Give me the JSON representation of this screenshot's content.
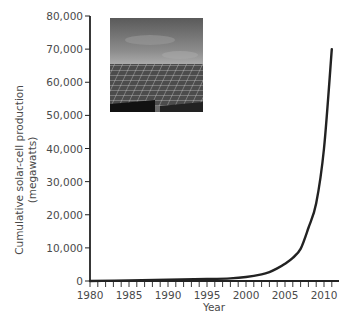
{
  "chart_data": {
    "type": "line",
    "title": "",
    "xlabel": "Year",
    "ylabel": "Cumulative solar-cell production (megawatts)",
    "ylabel_lines": [
      "Cumulative solar-cell production",
      "(megawatts)"
    ],
    "xlim": [
      1980,
      2011
    ],
    "ylim": [
      0,
      80000
    ],
    "x_ticks": [
      1980,
      1985,
      1990,
      1995,
      2000,
      2005,
      2010
    ],
    "x_tick_labels": [
      "1980",
      "1985",
      "1990",
      "1995",
      "2000",
      "2005",
      "2010"
    ],
    "y_ticks": [
      0,
      10000,
      20000,
      30000,
      40000,
      50000,
      60000,
      70000,
      80000
    ],
    "y_tick_labels": [
      "0",
      "10,000",
      "20,000",
      "30,000",
      "40,000",
      "50,000",
      "60,000",
      "70,000",
      "80,000"
    ],
    "grid": false,
    "legend": null,
    "series": [
      {
        "name": "Cumulative solar-cell production",
        "x": [
          1980,
          1985,
          1990,
          1995,
          1998,
          2000,
          2002,
          2003,
          2004,
          2005,
          2006,
          2007,
          2008,
          2009,
          2010,
          2011
        ],
        "values": [
          0,
          200,
          400,
          600,
          800,
          1200,
          2000,
          2700,
          3800,
          5200,
          7000,
          9700,
          16000,
          23500,
          40000,
          70000
        ]
      }
    ],
    "inset_image": "photo of solar panel array under cloudy sky"
  }
}
